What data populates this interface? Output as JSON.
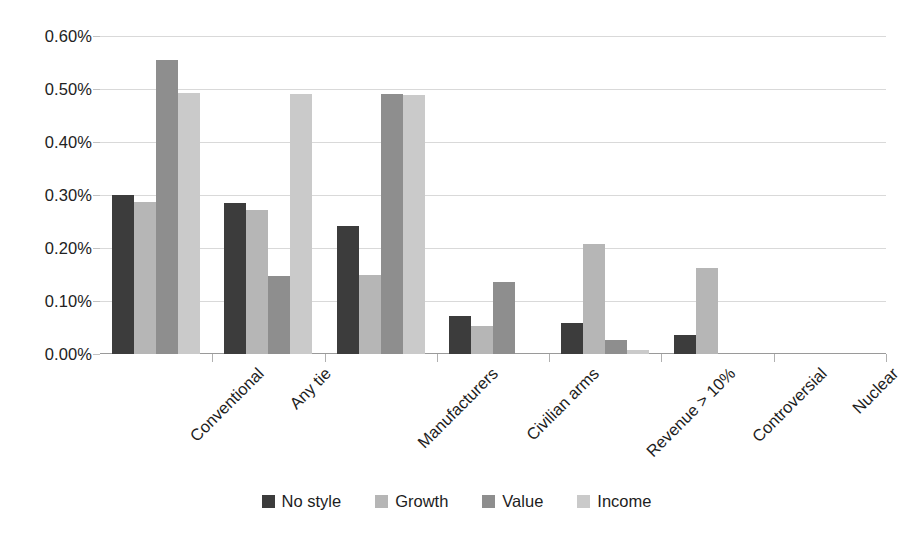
{
  "chart_data": {
    "type": "bar",
    "title": "",
    "subtitle": "",
    "xlabel": "",
    "ylabel": "",
    "categories": [
      "Conventional",
      "Any tie",
      "Manufacturers",
      "Civilian arms",
      "Revenue > 10%",
      "Controversial",
      "Nuclear"
    ],
    "series": [
      {
        "name": "No style",
        "color": "#3c3c3c",
        "values": [
          0.3,
          0.285,
          0.242,
          0.072,
          0.058,
          0.036,
          0.0
        ]
      },
      {
        "name": "Growth",
        "color": "#b6b6b6",
        "values": [
          0.287,
          0.272,
          0.15,
          0.052,
          0.208,
          0.162,
          0.0
        ]
      },
      {
        "name": "Value",
        "color": "#8e8e8e",
        "values": [
          0.555,
          0.147,
          0.49,
          0.135,
          0.027,
          0.0,
          0.0
        ]
      },
      {
        "name": "Income",
        "color": "#cacaca",
        "values": [
          0.492,
          0.49,
          0.488,
          0.0,
          0.007,
          0.0,
          0.0
        ]
      }
    ],
    "ylim": [
      0.0,
      0.6
    ],
    "ytick_values": [
      0.6,
      0.5,
      0.4,
      0.3,
      0.2,
      0.1,
      0.0
    ],
    "ytick_labels": [
      "0.60%",
      "0.50%",
      "0.40%",
      "0.30%",
      "0.20%",
      "0.10%",
      "0.00%"
    ],
    "value_unit": "%",
    "grid": true,
    "legend_position": "bottom",
    "xlabel_rotation": -45
  },
  "legend": {
    "items": [
      {
        "label": "No style",
        "color": "#3c3c3c"
      },
      {
        "label": "Growth",
        "color": "#b6b6b6"
      },
      {
        "label": "Value",
        "color": "#8e8e8e"
      },
      {
        "label": "Income",
        "color": "#cacaca"
      }
    ]
  },
  "colors": {
    "no_style": "#3c3c3c",
    "growth": "#b6b6b6",
    "value": "#8e8e8e",
    "income": "#cacaca",
    "gridline": "#d9d9d9",
    "axis": "#9a9a9a",
    "text": "#1d1d1d",
    "background": "#ffffff"
  }
}
